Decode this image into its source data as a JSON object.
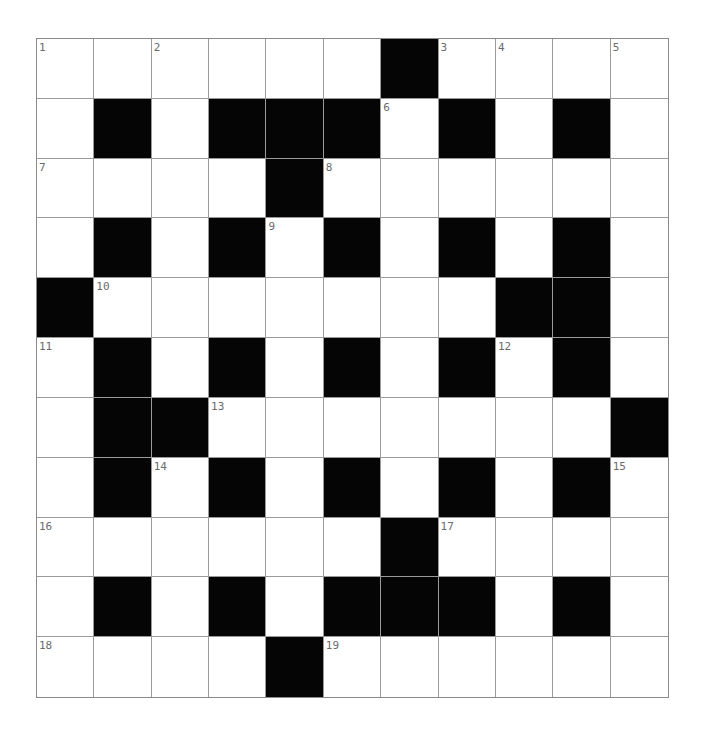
{
  "puzzle": {
    "rows": 11,
    "cols": 11,
    "colors": {
      "block": "#050505",
      "cell": "#ffffff",
      "grid_line": "#9a9a9a",
      "number": "#6b6b6b"
    },
    "layout": [
      "WWWWWWBWWWW",
      "WBWBBBWBWBW",
      "WWWWBWWWWWW",
      "WBWBWBWBWBW",
      "BWWWWWWWBBW",
      "WBWBWBWBWBW",
      "WBBWWWWWWWB",
      "WBWBWBWBWBW",
      "WWWWWWBWWWW",
      "WBWBWBBBWBW",
      "WWWWBWWWWWW"
    ],
    "numbers": [
      {
        "row": 0,
        "col": 0,
        "n": "1"
      },
      {
        "row": 0,
        "col": 2,
        "n": "2"
      },
      {
        "row": 0,
        "col": 7,
        "n": "3"
      },
      {
        "row": 0,
        "col": 8,
        "n": "4"
      },
      {
        "row": 0,
        "col": 10,
        "n": "5"
      },
      {
        "row": 1,
        "col": 6,
        "n": "6"
      },
      {
        "row": 2,
        "col": 0,
        "n": "7"
      },
      {
        "row": 2,
        "col": 5,
        "n": "8"
      },
      {
        "row": 3,
        "col": 4,
        "n": "9"
      },
      {
        "row": 4,
        "col": 1,
        "n": "10"
      },
      {
        "row": 5,
        "col": 0,
        "n": "11"
      },
      {
        "row": 5,
        "col": 8,
        "n": "12"
      },
      {
        "row": 6,
        "col": 3,
        "n": "13"
      },
      {
        "row": 7,
        "col": 2,
        "n": "14"
      },
      {
        "row": 7,
        "col": 10,
        "n": "15"
      },
      {
        "row": 8,
        "col": 0,
        "n": "16"
      },
      {
        "row": 8,
        "col": 7,
        "n": "17"
      },
      {
        "row": 10,
        "col": 0,
        "n": "18"
      },
      {
        "row": 10,
        "col": 5,
        "n": "19"
      }
    ]
  }
}
